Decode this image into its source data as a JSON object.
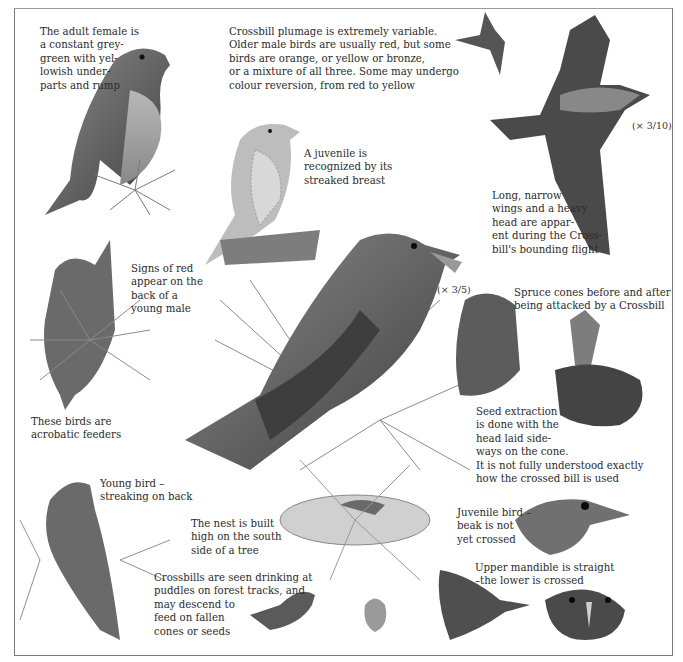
{
  "page": {
    "palette": {
      "ink": "#2b2b2b",
      "border": "#7a7a7a",
      "paper": "#ffffff",
      "bird_dark": "#3c3c3c",
      "bird_mid": "#6e6e6e",
      "bird_light": "#a8a8a8",
      "cone": "#5a5a5a"
    }
  },
  "captions": {
    "adult_female": "The adult female is\na constant grey-\ngreen with yel-\nlowish under-\nparts and rump",
    "plumage": "Crossbill plumage is extremely variable.\nOlder male birds are usually red, but some\nbirds are orange, or yellow or bronze,\nor a mixture of all three. Some may undergo\ncolour reversion, from red to yellow",
    "juvenile": "A juvenile is\nrecognized by its\nstreaked breast",
    "flight": "Long, narrow\nwings and a heavy\nhead are appar-\nent during the Cross-\nbill's bounding flight",
    "young_male": "Signs of red\nappear on the\nback of a\nyoung male",
    "acrobatic": "These birds are\nacrobatic feeders",
    "spruce_cones": "Spruce cones before and after\nbeing attacked by a Crossbill",
    "seed_extraction": "Seed extraction\nis done with the\nhead laid side-\nways on the cone.\nIt is not fully understood exactly\nhow the crossed bill is used",
    "young_bird": "Young bird –\nstreaking on back",
    "nest": "The nest is built\nhigh on the south\nside of a tree",
    "drinking": "Crossbills are seen drinking at\npuddles on forest tracks, and\nmay descend to\nfeed on fallen\ncones or seeds",
    "juvenile_bird": "Juvenile bird –\nbeak is not\nyet crossed",
    "mandible": "Upper mandible is straight\n–the lower is crossed"
  },
  "scales": {
    "flight_scale": "(× 3/10)",
    "main_scale": "(× 3/5)"
  },
  "illustrations": [
    "adult-female-perched",
    "juvenile-perched",
    "small-flying-bird",
    "large-flying-bird",
    "young-male-hanging",
    "adult-male-on-pine",
    "spruce-cone-before",
    "spruce-cone-after",
    "bird-on-cone",
    "young-bird-back",
    "nest-with-bird",
    "drinking-bird",
    "standing-bird-front",
    "juvenile-head",
    "head-side-profile",
    "head-front-view"
  ]
}
